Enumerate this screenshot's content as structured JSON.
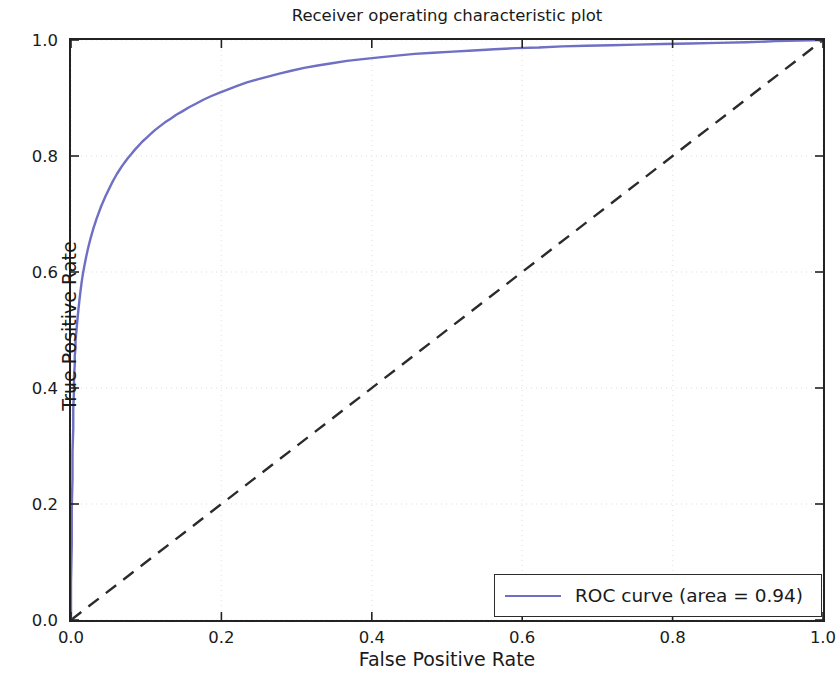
{
  "chart_data": {
    "type": "line",
    "title": "Receiver operating characteristic plot",
    "xlabel": "False Positive Rate",
    "ylabel": "True Positive Rate",
    "xlim": [
      0.0,
      1.0
    ],
    "ylim": [
      0.0,
      1.0
    ],
    "grid": true,
    "grid_style": "dotted",
    "grid_color": "#e8e8e8",
    "legend_position": "lower right",
    "xticks": [
      "0.0",
      "0.2",
      "0.4",
      "0.6",
      "0.8",
      "1.0"
    ],
    "xtick_values": [
      0.0,
      0.2,
      0.4,
      0.6,
      0.8,
      1.0
    ],
    "yticks": [
      "0.0",
      "0.2",
      "0.4",
      "0.6",
      "0.8",
      "1.0"
    ],
    "ytick_values": [
      0.0,
      0.2,
      0.4,
      0.6,
      0.8,
      1.0
    ],
    "series": [
      {
        "name": "ROC curve (area = 0.94)",
        "auc": 0.94,
        "color": "#6f6fc4",
        "linestyle": "solid",
        "linewidth": 2.0,
        "x": [
          0.0,
          0.0,
          0.001,
          0.001,
          0.002,
          0.002,
          0.003,
          0.003,
          0.004,
          0.004,
          0.005,
          0.005,
          0.006,
          0.006,
          0.007,
          0.008,
          0.009,
          0.01,
          0.011,
          0.012,
          0.013,
          0.014,
          0.015,
          0.016,
          0.018,
          0.02,
          0.022,
          0.024,
          0.026,
          0.028,
          0.03,
          0.032,
          0.034,
          0.036,
          0.038,
          0.04,
          0.043,
          0.046,
          0.049,
          0.052,
          0.055,
          0.058,
          0.061,
          0.064,
          0.068,
          0.072,
          0.076,
          0.08,
          0.085,
          0.09,
          0.095,
          0.1,
          0.106,
          0.112,
          0.118,
          0.125,
          0.132,
          0.14,
          0.148,
          0.157,
          0.166,
          0.176,
          0.186,
          0.197,
          0.209,
          0.221,
          0.234,
          0.248,
          0.262,
          0.277,
          0.293,
          0.31,
          0.328,
          0.347,
          0.367,
          0.388,
          0.41,
          0.433,
          0.457,
          0.482,
          0.508,
          0.535,
          0.563,
          0.592,
          0.622,
          0.653,
          0.685,
          0.718,
          0.752,
          0.787,
          0.823,
          0.86,
          0.898,
          0.937,
          0.968,
          1.0
        ],
        "y": [
          0.0,
          0.065,
          0.13,
          0.19,
          0.245,
          0.29,
          0.33,
          0.365,
          0.395,
          0.42,
          0.44,
          0.455,
          0.47,
          0.482,
          0.495,
          0.51,
          0.524,
          0.537,
          0.549,
          0.56,
          0.571,
          0.581,
          0.59,
          0.598,
          0.612,
          0.625,
          0.637,
          0.648,
          0.658,
          0.667,
          0.676,
          0.684,
          0.692,
          0.699,
          0.706,
          0.713,
          0.722,
          0.731,
          0.739,
          0.747,
          0.755,
          0.762,
          0.769,
          0.775,
          0.783,
          0.79,
          0.797,
          0.803,
          0.811,
          0.818,
          0.825,
          0.831,
          0.838,
          0.845,
          0.851,
          0.858,
          0.864,
          0.871,
          0.877,
          0.884,
          0.89,
          0.897,
          0.903,
          0.909,
          0.915,
          0.921,
          0.927,
          0.932,
          0.937,
          0.942,
          0.947,
          0.952,
          0.956,
          0.96,
          0.964,
          0.967,
          0.97,
          0.973,
          0.976,
          0.978,
          0.98,
          0.982,
          0.984,
          0.986,
          0.987,
          0.989,
          0.99,
          0.991,
          0.992,
          0.993,
          0.994,
          0.995,
          0.996,
          0.998,
          0.999,
          1.0
        ]
      },
      {
        "name": "chance-diagonal",
        "color": "#2b2b2b",
        "linestyle": "dashed",
        "linewidth": 2.0,
        "x": [
          0.0,
          1.0
        ],
        "y": [
          0.0,
          1.0
        ]
      }
    ]
  },
  "legend": {
    "entries": [
      {
        "label": "ROC curve (area = 0.94)",
        "color": "#6f6fc4"
      }
    ]
  }
}
